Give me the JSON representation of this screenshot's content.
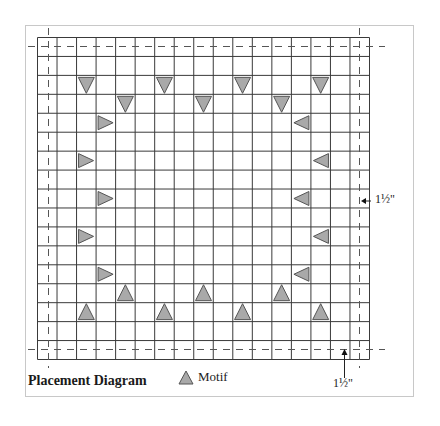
{
  "diagram": {
    "title": "Placement Diagram",
    "legend": {
      "icon": "triangle-motif-icon",
      "label": "Motif"
    },
    "dimensions": {
      "right_label": "1½\"",
      "bottom_label": "1½\""
    },
    "colors": {
      "grid_line": "#3a3a3a",
      "dashed_line": "#555555",
      "motif_fill": "#a9a9a9",
      "motif_stroke": "#555555",
      "frame": "#c8c8c8"
    },
    "grid": {
      "columns": 17,
      "rows": 17
    },
    "motifs": [
      {
        "row": 2,
        "col": 2,
        "dir": "down"
      },
      {
        "row": 2,
        "col": 6,
        "dir": "down"
      },
      {
        "row": 2,
        "col": 10,
        "dir": "down"
      },
      {
        "row": 2,
        "col": 14,
        "dir": "down"
      },
      {
        "row": 3,
        "col": 4,
        "dir": "down"
      },
      {
        "row": 3,
        "col": 8,
        "dir": "down"
      },
      {
        "row": 3,
        "col": 12,
        "dir": "down"
      },
      {
        "row": 4,
        "col": 3,
        "dir": "right"
      },
      {
        "row": 4,
        "col": 13,
        "dir": "left"
      },
      {
        "row": 6,
        "col": 2,
        "dir": "right"
      },
      {
        "row": 6,
        "col": 14,
        "dir": "left"
      },
      {
        "row": 8,
        "col": 3,
        "dir": "right"
      },
      {
        "row": 8,
        "col": 13,
        "dir": "left"
      },
      {
        "row": 10,
        "col": 2,
        "dir": "right"
      },
      {
        "row": 10,
        "col": 14,
        "dir": "left"
      },
      {
        "row": 12,
        "col": 3,
        "dir": "right"
      },
      {
        "row": 12,
        "col": 13,
        "dir": "left"
      },
      {
        "row": 13,
        "col": 4,
        "dir": "up"
      },
      {
        "row": 13,
        "col": 8,
        "dir": "up"
      },
      {
        "row": 13,
        "col": 12,
        "dir": "up"
      },
      {
        "row": 14,
        "col": 2,
        "dir": "up"
      },
      {
        "row": 14,
        "col": 6,
        "dir": "up"
      },
      {
        "row": 14,
        "col": 10,
        "dir": "up"
      },
      {
        "row": 14,
        "col": 14,
        "dir": "up"
      }
    ]
  }
}
